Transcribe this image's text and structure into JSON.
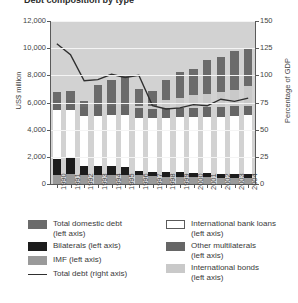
{
  "title_partial": "Debt composition by type",
  "chart_data": {
    "type": "bar",
    "title": "Debt composition by type",
    "xlabel": "",
    "ylabel": "US$ million",
    "ylabel_right": "Percentage of GDP",
    "ylim": [
      0,
      12000
    ],
    "ylim_right": [
      0,
      150
    ],
    "yticks": [
      "0",
      "2,000",
      "4,000",
      "6,000",
      "8,000",
      "10,000",
      "12,000"
    ],
    "yticks_right": [
      "0",
      "25",
      "50",
      "75",
      "100",
      "125",
      "150"
    ],
    "grid": true,
    "legend_position": "below",
    "categories": [
      "1990",
      "1991",
      "1992",
      "1993",
      "1994",
      "1995",
      "1996",
      "1997",
      "1998",
      "1999",
      "2000",
      "2001",
      "2002",
      "2003",
      "2004"
    ],
    "stacked": true,
    "series": [
      {
        "name": "IMF (left axis)",
        "color": "#9a9a9a",
        "values": [
          700,
          720,
          700,
          700,
          680,
          660,
          640,
          560,
          540,
          520,
          500,
          480,
          460,
          460,
          450
        ]
      },
      {
        "name": "Bilaterals (left axis)",
        "color": "#1c1c1c",
        "values": [
          1150,
          1160,
          600,
          620,
          620,
          620,
          330,
          330,
          330,
          330,
          320,
          320,
          310,
          310,
          300
        ]
      },
      {
        "name": "International bank loans (left axis)",
        "color": "#ffffff",
        "values": [
          3600,
          3600,
          3700,
          3700,
          3750,
          3800,
          3900,
          3950,
          4000,
          4050,
          4100,
          4150,
          4200,
          4250,
          4300
        ]
      },
      {
        "name": "Other multilaterals (left axis)",
        "color": "#666666",
        "values": [
          700,
          700,
          700,
          700,
          700,
          700,
          700,
          700,
          700,
          700,
          700,
          700,
          700,
          700,
          700
        ]
      },
      {
        "name": "International bonds (left axis)",
        "color": "#c9c9c9",
        "values": [
          0,
          0,
          0,
          0,
          0,
          0,
          150,
          200,
          600,
          700,
          900,
          1000,
          1100,
          1200,
          1450
        ]
      },
      {
        "name": "Total domestic debt (left axis)",
        "color": "#6b6b6b",
        "values": [
          600,
          700,
          400,
          1600,
          1900,
          2250,
          1300,
          1100,
          1500,
          1950,
          1950,
          2450,
          2600,
          2850,
          2750
        ]
      }
    ],
    "line_series": {
      "name": "Total debt (right axis)",
      "axis": "right",
      "color": "#2f2f2f",
      "values": [
        129,
        119,
        95,
        96,
        101,
        98,
        100,
        72,
        69,
        70,
        73,
        72,
        78,
        76,
        79
      ]
    }
  },
  "legend": {
    "left_column": [
      {
        "label_line1": "Total domestic debt",
        "label_line2": "(left axis)",
        "swatch": "#6b6b6b",
        "type": "box"
      },
      {
        "label_line1": "Bilaterals (left axis)",
        "label_line2": "",
        "swatch": "#1c1c1c",
        "type": "box"
      },
      {
        "label_line1": "IMF (left axis)",
        "label_line2": "",
        "swatch": "#9a9a9a",
        "type": "box"
      },
      {
        "label_line1": "Total debt (right axis)",
        "label_line2": "",
        "swatch": "#2f2f2f",
        "type": "line"
      }
    ],
    "right_column": [
      {
        "label_line1": "International bank loans",
        "label_line2": "(left axis)",
        "swatch": "#ffffff",
        "type": "box-outline"
      },
      {
        "label_line1": "Other multilaterals",
        "label_line2": "(left axis)",
        "swatch": "#666666",
        "type": "box"
      },
      {
        "label_line1": "International bonds",
        "label_line2": "(left axis)",
        "swatch": "#c9c9c9",
        "type": "box"
      }
    ]
  }
}
